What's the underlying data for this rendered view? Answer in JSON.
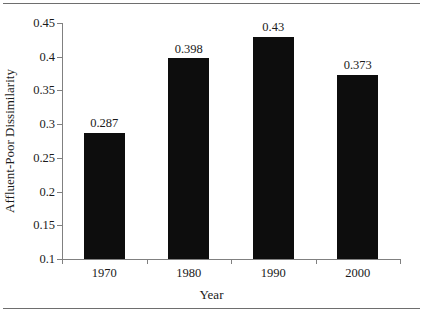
{
  "chart_data": {
    "type": "bar",
    "title": "",
    "categories": [
      "1970",
      "1980",
      "1990",
      "2000"
    ],
    "values": [
      0.287,
      0.398,
      0.43,
      0.373
    ],
    "value_labels": [
      "0.287",
      "0.398",
      "0.43",
      "0.373"
    ],
    "xlabel": "Year",
    "ylabel": "Affluent-Poor Dissimilarity",
    "ylim": [
      0.1,
      0.45
    ],
    "yticks": [
      0.1,
      0.15,
      0.2,
      0.25,
      0.3,
      0.35,
      0.4,
      0.45
    ],
    "ytick_labels": [
      "0.1",
      "0.15",
      "0.2",
      "0.25",
      "0.3",
      "0.35",
      "0.4",
      "0.45"
    ],
    "grid": false,
    "legend": null,
    "bar_color": "#0d0d0d",
    "axis_color": "#808080",
    "text_color": "#1a1a1a",
    "background": "#ffffff"
  }
}
